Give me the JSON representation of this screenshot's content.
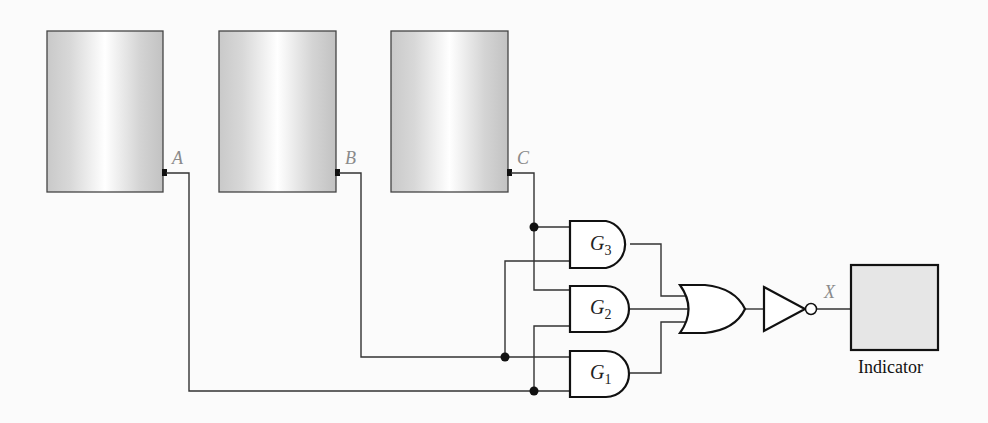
{
  "diagram": {
    "type": "logic-circuit",
    "sources": [
      {
        "id": "A",
        "label": "A"
      },
      {
        "id": "B",
        "label": "B"
      },
      {
        "id": "C",
        "label": "C"
      }
    ],
    "gates": [
      {
        "id": "G3",
        "type": "AND",
        "label_main": "G",
        "label_sub": "3",
        "inputs": [
          "C",
          "B"
        ]
      },
      {
        "id": "G2",
        "type": "AND",
        "label_main": "G",
        "label_sub": "2",
        "inputs": [
          "C",
          "A"
        ]
      },
      {
        "id": "G1",
        "type": "AND",
        "label_main": "G",
        "label_sub": "1",
        "inputs": [
          "B",
          "A"
        ]
      },
      {
        "id": "OR",
        "type": "OR",
        "inputs": [
          "G3",
          "G2",
          "G1"
        ]
      },
      {
        "id": "NOT",
        "type": "NOT",
        "inputs": [
          "OR"
        ]
      }
    ],
    "output": {
      "label": "X"
    },
    "indicator": {
      "label": "Indicator"
    }
  },
  "colors": {
    "wire": "#333333",
    "label_gray": "#8a8a8a",
    "box_edge": "#555555",
    "indicator_fill": "#e6e6e6"
  }
}
